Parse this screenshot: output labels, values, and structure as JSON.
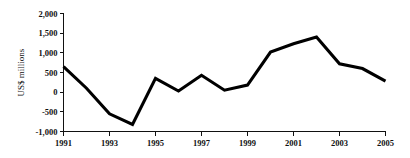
{
  "chart_data": {
    "type": "line",
    "title": "",
    "xlabel": "",
    "ylabel": "US$ millions",
    "x": [
      1991,
      1992,
      1993,
      1994,
      1995,
      1996,
      1997,
      1998,
      1999,
      2000,
      2001,
      2002,
      2003,
      2004,
      2005
    ],
    "values": [
      650,
      100,
      -550,
      -820,
      350,
      30,
      430,
      50,
      180,
      1020,
      1230,
      1400,
      720,
      600,
      280
    ],
    "series": [
      {
        "name": "US$ millions",
        "values": [
          650,
          100,
          -550,
          -820,
          350,
          30,
          430,
          50,
          180,
          1020,
          1230,
          1400,
          720,
          600,
          280
        ]
      }
    ],
    "xlim": [
      1991,
      2005
    ],
    "ylim": [
      -1000,
      2000
    ],
    "ytick_values": [
      2000,
      1500,
      1000,
      500,
      0,
      -500,
      -1000
    ],
    "ytick_labels": [
      "2,000",
      "1,500",
      "1,000",
      "500",
      "0",
      "-500",
      "-1,000"
    ],
    "xtick_values": [
      1991,
      1993,
      1995,
      1997,
      1999,
      2001,
      2003,
      2005
    ],
    "xtick_labels": [
      "1991",
      "1993",
      "1995",
      "1997",
      "1999",
      "2001",
      "2003",
      "2005"
    ],
    "grid": false,
    "legend": false,
    "legend_position": "none",
    "line_color": "#000000",
    "axis_color": "#111111",
    "background_color": "#ffffff"
  }
}
